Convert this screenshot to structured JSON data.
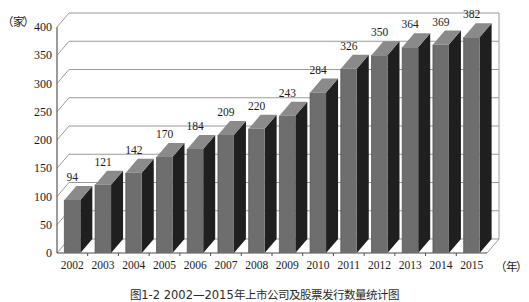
{
  "chart_data": {
    "type": "bar",
    "title": "",
    "xlabel": "（年）",
    "ylabel": "（家）",
    "categories": [
      "2002",
      "2003",
      "2004",
      "2005",
      "2006",
      "2007",
      "2008",
      "2009",
      "2010",
      "2011",
      "2012",
      "2013",
      "2014",
      "2015"
    ],
    "values": [
      94,
      121,
      142,
      170,
      184,
      209,
      220,
      243,
      284,
      326,
      350,
      364,
      369,
      382
    ],
    "value_labels": [
      "94",
      "121",
      "142",
      "170",
      "184",
      "209",
      "220",
      "243",
      "284",
      "326",
      "350",
      "364",
      "369",
      "382"
    ],
    "ylim": [
      0,
      400
    ],
    "yticks": [
      400,
      350,
      300,
      250,
      200,
      150,
      100,
      50,
      0
    ],
    "ytick_labels": [
      "400",
      "350",
      "300",
      "250",
      "200",
      "150",
      "100",
      "50",
      "0"
    ],
    "grid": true,
    "legend": null,
    "style": "3d-column",
    "colors": {
      "bar_front": "#6e6e6e",
      "bar_side": "#1f1f1f",
      "bar_top": "#8a8a8a",
      "grid": "#9a9a9a",
      "axis": "#4a4a4a",
      "text": "#1a1a1a",
      "background": "#ffffff"
    }
  },
  "caption": {
    "text": "图1-2 2002—2015年上市公司及股票发行数量统计图"
  }
}
